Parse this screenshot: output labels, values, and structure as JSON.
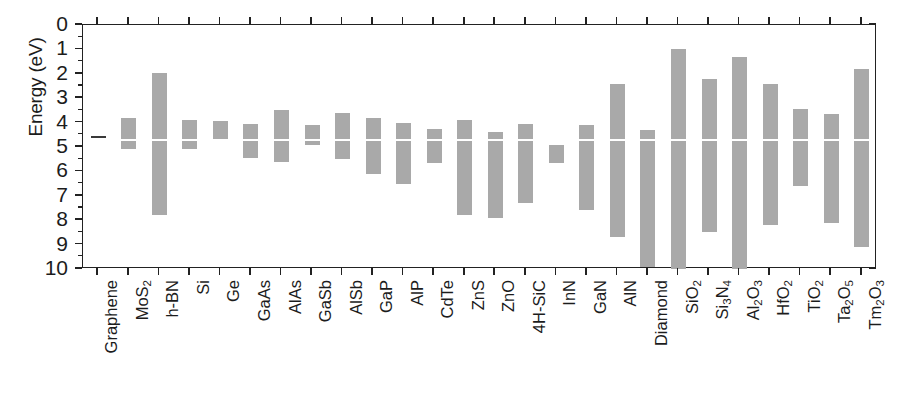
{
  "chart_data": {
    "type": "bar",
    "title": "",
    "subtitle": "",
    "xlabel": "",
    "ylabel": "Energy (eV)",
    "ylim": [
      0,
      10
    ],
    "y_inverted": true,
    "grid": false,
    "legend": null,
    "y_ticks": [
      0,
      1,
      2,
      3,
      4,
      5,
      6,
      7,
      8,
      9,
      10
    ],
    "y_tick_labels": [
      "0",
      "1",
      "2",
      "3",
      "4",
      "5",
      "6",
      "7",
      "8",
      "9",
      "10"
    ],
    "bar_color": "#a9a9a9",
    "reference_line_color": "#ffffff",
    "reference_line_value": 4.7,
    "categories": [
      "Graphene",
      "MoS2",
      "h-BN",
      "Si",
      "Ge",
      "GaAs",
      "AlAs",
      "GaSb",
      "AlSb",
      "GaP",
      "AlP",
      "CdTe",
      "ZnS",
      "ZnO",
      "4H-SiC",
      "InN",
      "GaN",
      "AlN",
      "Diamond",
      "SiO2",
      "Si3N4",
      "Al2O3",
      "HfO2",
      "TiO2",
      "Ta2O5",
      "Tm2O3"
    ],
    "bars": [
      {
        "label": "Graphene",
        "label_html": "Graphene",
        "top": 4.55,
        "bottom": 4.65,
        "is_line": true
      },
      {
        "label": "MoS2",
        "label_html": "MoS<sub>2</sub>",
        "top": 3.8,
        "bottom": 5.1
      },
      {
        "label": "h-BN",
        "label_html": "h-BN",
        "top": 1.95,
        "bottom": 7.8
      },
      {
        "label": "Si",
        "label_html": "Si",
        "top": 3.9,
        "bottom": 5.1
      },
      {
        "label": "Ge",
        "label_html": "Ge",
        "top": 3.95,
        "bottom": 4.75
      },
      {
        "label": "GaAs",
        "label_html": "GaAs",
        "top": 4.05,
        "bottom": 5.45
      },
      {
        "label": "AlAs",
        "label_html": "AlAs",
        "top": 3.5,
        "bottom": 5.6
      },
      {
        "label": "GaSb",
        "label_html": "GaSb",
        "top": 4.1,
        "bottom": 4.9
      },
      {
        "label": "AlSb",
        "label_html": "AlSb",
        "top": 3.6,
        "bottom": 5.5
      },
      {
        "label": "GaP",
        "label_html": "GaP",
        "top": 3.8,
        "bottom": 6.1
      },
      {
        "label": "AlP",
        "label_html": "AlP",
        "top": 4.0,
        "bottom": 6.5
      },
      {
        "label": "CdTe",
        "label_html": "CdTe",
        "top": 4.25,
        "bottom": 5.65
      },
      {
        "label": "ZnS",
        "label_html": "ZnS",
        "top": 3.9,
        "bottom": 7.8
      },
      {
        "label": "ZnO",
        "label_html": "ZnO",
        "top": 4.4,
        "bottom": 7.9
      },
      {
        "label": "4H-SiC",
        "label_html": "4H-SiC",
        "top": 4.05,
        "bottom": 7.3
      },
      {
        "label": "InN",
        "label_html": "InN",
        "top": 4.9,
        "bottom": 5.65
      },
      {
        "label": "GaN",
        "label_html": "GaN",
        "top": 4.1,
        "bottom": 7.6
      },
      {
        "label": "AlN",
        "label_html": "AlN",
        "top": 2.4,
        "bottom": 8.7
      },
      {
        "label": "Diamond",
        "label_html": "Diamond",
        "top": 4.3,
        "bottom": 9.9
      },
      {
        "label": "SiO2",
        "label_html": "SiO<sub>2</sub>",
        "top": 1.0,
        "bottom": 10.0
      },
      {
        "label": "Si3N4",
        "label_html": "Si<sub>3</sub>N<sub>4</sub>",
        "top": 2.2,
        "bottom": 8.5
      },
      {
        "label": "Al2O3",
        "label_html": "Al<sub>2</sub>O<sub>3</sub>",
        "top": 1.3,
        "bottom": 10.0
      },
      {
        "label": "HfO2",
        "label_html": "HfO<sub>2</sub>",
        "top": 2.4,
        "bottom": 8.2
      },
      {
        "label": "TiO2",
        "label_html": "TiO<sub>2</sub>",
        "top": 3.45,
        "bottom": 6.6
      },
      {
        "label": "Ta2O5",
        "label_html": "Ta<sub>2</sub>O<sub>5</sub>",
        "top": 3.65,
        "bottom": 8.1
      },
      {
        "label": "Tm2O3",
        "label_html": "Tm<sub>2</sub>O<sub>3</sub>",
        "top": 1.8,
        "bottom": 9.1
      }
    ]
  }
}
